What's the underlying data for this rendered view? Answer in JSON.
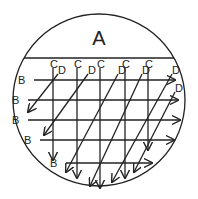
{
  "diagram": {
    "region_label": "A",
    "row_label": "B",
    "column_label": "C",
    "diagonal_label": "D",
    "rows": [
      {
        "label": "B",
        "y": 80,
        "x1": 34,
        "x2": 175
      },
      {
        "label": "B",
        "y": 100,
        "x1": 28,
        "x2": 178
      },
      {
        "label": "B",
        "y": 120,
        "x1": 28,
        "x2": 180
      },
      {
        "label": "B",
        "y": 140,
        "x1": 40,
        "x2": 174
      },
      {
        "label": "B",
        "y": 163,
        "x1": 66,
        "x2": 152
      }
    ],
    "columns": [
      {
        "label": "C",
        "x": 53,
        "y2": 160
      },
      {
        "label": "C",
        "x": 77,
        "y2": 178
      },
      {
        "label": "C",
        "x": 100,
        "y2": 188
      },
      {
        "label": "C",
        "x": 125,
        "y2": 178
      },
      {
        "label": "C",
        "x": 148,
        "y2": 150
      }
    ],
    "diagonals": [
      {
        "label": "D",
        "x1": 58,
        "y1": 74,
        "x2": 28,
        "y2": 112
      },
      {
        "label": "D",
        "x1": 88,
        "y1": 74,
        "x2": 44,
        "y2": 135
      },
      {
        "label": "D",
        "x1": 118,
        "y1": 74,
        "x2": 66,
        "y2": 172
      },
      {
        "label": "D",
        "x1": 142,
        "y1": 74,
        "x2": 90,
        "y2": 186
      },
      {
        "label": "D",
        "x1": 172,
        "y1": 74,
        "x2": 112,
        "y2": 182
      },
      {
        "label": "D",
        "x1": 175,
        "y1": 92,
        "x2": 134,
        "y2": 172
      }
    ],
    "colors": {
      "stroke": "#222222",
      "background": "#ffffff"
    }
  }
}
